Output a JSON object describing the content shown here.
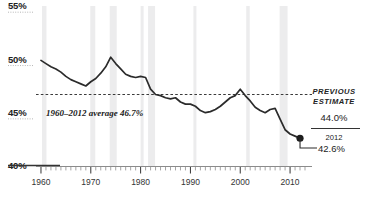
{
  "chart_data": {
    "type": "line",
    "title": "",
    "xlabel": "",
    "ylabel": "",
    "xlim": [
      1959,
      2013.6
    ],
    "ylim": [
      40,
      55
    ],
    "grid": false,
    "legend_position": "none",
    "y_ticks": [
      "55%",
      "50%",
      "45%",
      "40%"
    ],
    "y_tick_values": [
      55,
      50,
      45,
      40
    ],
    "x_ticks": [
      "1960",
      "1970",
      "1980",
      "1990",
      "2000",
      "2010"
    ],
    "x_tick_values": [
      1960,
      1970,
      1980,
      1990,
      2000,
      2010
    ],
    "x_minor_tick_interval": 1,
    "line_color": "#2b2b2b",
    "series": [
      {
        "name": "share",
        "x": [
          1960,
          1961,
          1962,
          1963,
          1964,
          1965,
          1966,
          1967,
          1968,
          1969,
          1970,
          1971,
          1972,
          1973,
          1974,
          1975,
          1976,
          1977,
          1978,
          1979,
          1980,
          1981,
          1982,
          1983,
          1984,
          1985,
          1986,
          1987,
          1988,
          1989,
          1990,
          1991,
          1992,
          1993,
          1994,
          1995,
          1996,
          1997,
          1998,
          1999,
          2000,
          2001,
          2002,
          2003,
          2004,
          2005,
          2006,
          2007,
          2008,
          2009,
          2010,
          2011,
          2012
        ],
        "values": [
          49.9,
          49.6,
          49.3,
          49.1,
          48.8,
          48.4,
          48.1,
          47.9,
          47.7,
          47.5,
          47.9,
          48.2,
          48.7,
          49.3,
          50.2,
          49.6,
          49.1,
          48.6,
          48.4,
          48.3,
          48.4,
          48.3,
          47.2,
          46.7,
          46.6,
          46.4,
          46.3,
          46.4,
          46.0,
          45.8,
          45.8,
          45.6,
          45.2,
          45.0,
          45.1,
          45.3,
          45.6,
          46.0,
          46.4,
          46.6,
          47.2,
          46.6,
          46.1,
          45.5,
          45.2,
          45.0,
          45.3,
          45.4,
          44.4,
          43.4,
          43.0,
          42.8,
          42.6
        ]
      }
    ],
    "reference_line": {
      "value": 46.7,
      "style": "dashed",
      "label": "1960–2012 average 46.7%"
    },
    "endpoint_marker": {
      "x": 2012,
      "y": 42.6,
      "visible": true
    },
    "shaded_bands": [
      {
        "start": 1960.2,
        "end": 1961.1
      },
      {
        "start": 1969.9,
        "end": 1970.9
      },
      {
        "start": 1973.8,
        "end": 1975.2
      },
      {
        "start": 1980.0,
        "end": 1980.6
      },
      {
        "start": 1981.5,
        "end": 1982.9
      },
      {
        "start": 1990.6,
        "end": 1991.2
      },
      {
        "start": 2001.2,
        "end": 2001.9
      },
      {
        "start": 2007.9,
        "end": 2009.5
      }
    ],
    "band_color": "#ececed"
  },
  "annotations": {
    "previous_estimate_label_line1": "PREVIOUS",
    "previous_estimate_label_line2": "ESTIMATE",
    "previous_estimate_value": "44.0%",
    "current_year": "2012",
    "current_value": "42.6%"
  }
}
